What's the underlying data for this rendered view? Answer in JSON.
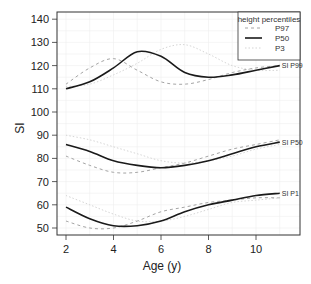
{
  "chart_data": {
    "type": "line",
    "title": "",
    "xlabel": "Age (y)",
    "ylabel": "SI",
    "xlim": [
      1.6,
      11.8
    ],
    "ylim": [
      46.5,
      143
    ],
    "xticks": [
      2,
      4,
      6,
      8,
      10
    ],
    "yticks": [
      50,
      60,
      70,
      80,
      90,
      100,
      110,
      120,
      130,
      140
    ],
    "grid": true,
    "legend": {
      "title": "height percentiles",
      "position": "top-right",
      "entries": [
        {
          "label": "P97",
          "style": "dashed",
          "color": "#999999"
        },
        {
          "label": "P50",
          "style": "solid",
          "color": "#222222"
        },
        {
          "label": "P3",
          "style": "dotted",
          "color": "#cccccc"
        }
      ]
    },
    "groups": [
      {
        "label": "SI P99",
        "series": [
          {
            "name": "P97",
            "x": [
              2,
              3,
              4,
              5,
              6,
              7,
              8,
              9,
              10,
              11
            ],
            "y": [
              112,
              119,
              123,
              118,
              113,
              112,
              114,
              117,
              119,
              120
            ]
          },
          {
            "name": "P50",
            "x": [
              2,
              3,
              4,
              5,
              6,
              7,
              8,
              9,
              10,
              11
            ],
            "y": [
              110,
              113,
              119,
              126,
              124,
              117,
              115,
              116,
              118,
              120
            ]
          },
          {
            "name": "P3",
            "x": [
              2,
              3,
              4,
              5,
              6,
              7,
              8,
              9,
              10,
              11
            ],
            "y": [
              111,
              112,
              116,
              121,
              127,
              129,
              125,
              120,
              118,
              118
            ]
          }
        ]
      },
      {
        "label": "SI P50",
        "series": [
          {
            "name": "P97",
            "x": [
              2,
              3,
              4,
              5,
              6,
              7,
              8,
              9,
              10,
              11
            ],
            "y": [
              81,
              77,
              74,
              74,
              76,
              78,
              81,
              84,
              86,
              88
            ]
          },
          {
            "name": "P50",
            "x": [
              2,
              3,
              4,
              5,
              6,
              7,
              8,
              9,
              10,
              11
            ],
            "y": [
              86,
              83,
              79,
              77,
              76,
              77,
              79,
              82,
              85,
              87
            ]
          },
          {
            "name": "P3",
            "x": [
              2,
              3,
              4,
              5,
              6,
              7,
              8,
              9,
              10,
              11
            ],
            "y": [
              90,
              88,
              85,
              82,
              79,
              78,
              79,
              81,
              84,
              86
            ]
          }
        ]
      },
      {
        "label": "SI P1",
        "series": [
          {
            "name": "P97",
            "x": [
              2,
              3,
              4,
              5,
              6,
              7,
              8,
              9,
              10,
              11
            ],
            "y": [
              53,
              50,
              50,
              53,
              57,
              59,
              61,
              62,
              63,
              63
            ]
          },
          {
            "name": "P50",
            "x": [
              2,
              3,
              4,
              5,
              6,
              7,
              8,
              9,
              10,
              11
            ],
            "y": [
              59,
              54,
              51,
              51,
              53,
              57,
              60,
              62,
              64,
              65
            ]
          },
          {
            "name": "P3",
            "x": [
              2,
              3,
              4,
              5,
              6,
              7,
              8,
              9,
              10,
              11
            ],
            "y": [
              64,
              60,
              56,
              53,
              53,
              55,
              58,
              61,
              62,
              63
            ]
          }
        ]
      }
    ]
  }
}
